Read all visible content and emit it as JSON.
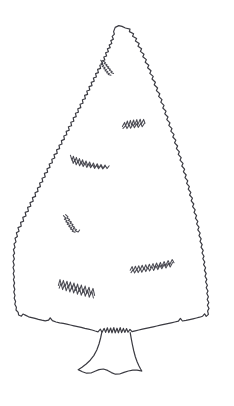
{
  "image": {
    "title": "Evergreen Tree Line Drawing",
    "subject": "conifer-tree",
    "style": "hand-drawn-ink-outline",
    "width": 234,
    "height": 406,
    "background_color": "#ffffff",
    "ink_color": "#3b3b42",
    "branch_ink_color": "#4a4a52"
  },
  "tree": {
    "canopy": {
      "label": "Jagged triangular conifer canopy outline",
      "apex": {
        "x": 115,
        "y": 27
      },
      "left_extent_x": 13,
      "right_extent_x": 209,
      "baseline_y": 333,
      "path": "M115.2,27.4 L113.6,31.6 L114.4,34.2 L112.2,36.4 L113.4,39.2 L110.8,40.6 L111.8,43.4 L109.2,45.0 L110.2,47.6 L107.4,48.8 L108.4,51.8 L105.6,52.8 L106.6,56.0 L103.8,57.0 L104.8,60.0 L101.8,61.0 L102.6,64.2 L99.8,65.2 L100.6,68.4 L97.6,69.4 L98.4,72.6 L95.6,73.6 L96.4,77.0 L93.4,78.0 L94.2,81.2 L91.2,82.4 L92.0,85.6 L89.0,86.6 L89.8,90.0 L86.8,91.0 L87.6,94.4 L84.6,95.4 L85.4,98.8 L82.4,99.8 L83.0,103.2 L80.0,104.2 L80.8,107.6 L77.8,108.8 L78.4,112.2 L75.4,113.2 L76.2,116.6 L73.2,117.8 L73.8,121.2 L70.8,122.2 L71.6,125.8 L68.4,126.8 L69.2,130.2 L66.2,131.4 L66.8,134.8 L63.8,136.0 L64.4,139.4 L61.4,140.6 L62.0,144.0 L59.0,145.2 L59.6,148.6 L56.6,149.8 L57.2,153.4 L54.0,154.6 L54.8,158.0 L51.8,159.2 L52.4,162.8 L49.2,164.0 L50.0,167.4 L47.0,168.8 L47.6,172.2 L44.4,173.4 L45.2,177.0 L42.0,178.2 L42.8,181.8 L39.6,183.0 L40.4,186.6 L37.4,188.0 L38.0,191.4 L35.0,192.8 L35.6,196.4 L32.4,197.6 L33.2,201.2 L30.0,202.6 L30.8,206.2 L27.6,207.4 L28.4,211.2 L25.2,212.4 L26.0,216.0 L22.8,217.4 L23.6,221.2 L20.6,222.4 L21.2,226.2 L18.0,227.6 L19.0,231.2 L16.4,232.8 L17.4,236.4 L15.0,238.2 L16.0,241.8 L14.0,243.8 L15.0,247.4 L13.4,249.6 L14.6,253.2 L13.2,255.4 L14.4,259.0 L13.0,261.4 L14.2,265.0 L13.0,267.4 L14.2,271.0 L13.2,273.6 L14.4,277.0 L13.4,279.6 L14.6,283.0 L13.6,285.8 L14.8,289.2 L13.8,292.0 L15.0,295.4 L14.2,298.2 L15.6,301.4 L14.8,304.2 L16.4,307.2 L16.0,310.0 L18.2,312.4 L18.6,315.0 L21.4,316.2 L23.0,314.0 L25.8,315.4 L28.6,316.8 L31.8,317.6 L35.0,318.4 L38.4,319.4 L41.8,320.2 L45.2,320.8 L48.6,320.2 L50.2,317.8 L52.4,320.6 L56.0,322.0 L59.6,322.8 L63.2,323.4 L66.8,324.2 L70.4,325.0 L74.0,325.8 L77.6,326.6 L81.2,327.4 L84.8,328.4 L88.4,329.2 L92.0,330.0 L95.2,331.0 L98.0,331.8 L100.4,329.2 L102.0,332.2 L104.2,328.4 L105.6,332.4 L107.4,327.8 L108.8,332.6 L110.6,328.0 L112.0,332.8 L113.8,327.6 L115.2,332.8 L117.0,328.2 L118.4,332.8 L120.2,327.6 L121.6,332.6 L123.4,328.4 L124.8,332.4 L126.6,328.6 L128.0,332.2 L130.0,329.4 L132.0,331.6 L135.2,330.8 L138.8,330.0 L142.4,329.2 L146.0,328.4 L149.6,327.6 L153.2,326.8 L156.8,326.0 L160.4,325.2 L164.0,324.4 L167.6,323.6 L171.2,322.8 L174.8,322.0 L178.4,321.2 L180.4,318.4 L182.4,321.0 L186.0,320.4 L189.6,319.6 L193.0,318.8 L196.4,318.0 L199.6,317.2 L202.6,316.2 L204.6,313.8 L206.2,316.4 L208.4,314.4 L207.6,311.0 L209.0,308.4 L207.4,305.2 L208.8,302.6 L207.2,299.4 L208.4,296.8 L206.8,293.6 L208.0,291.0 L206.2,287.8 L207.4,285.2 L205.6,282.0 L206.8,279.4 L205.0,276.2 L206.2,273.6 L204.4,270.4 L205.6,267.8 L203.6,264.6 L204.8,262.0 L202.8,258.8 L204.0,256.2 L202.0,253.0 L203.2,250.4 L201.0,247.2 L202.2,244.6 L200.0,241.4 L201.2,238.8 L199.0,235.6 L200.2,233.0 L197.8,229.8 L199.0,227.2 L196.6,224.0 L197.8,221.4 L195.4,218.2 L196.6,215.6 L194.0,212.4 L195.2,209.8 L192.6,206.6 L193.8,204.0 L191.2,200.8 L192.4,198.2 L189.6,195.0 L190.8,192.4 L188.2,189.2 L189.4,186.6 L186.6,183.4 L187.8,180.8 L185.0,177.6 L186.2,175.0 L183.4,171.8 L184.6,169.2 L181.8,166.0 L183.0,163.4 L180.0,160.2 L181.2,157.6 L178.2,154.4 L179.4,151.8 L176.4,148.6 L177.6,146.0 L174.6,142.8 L175.8,140.2 L172.8,137.0 L174.0,134.4 L170.8,131.2 L172.0,128.6 L168.8,125.4 L170.0,122.8 L166.8,119.6 L168.0,117.0 L164.8,113.8 L166.0,111.2 L162.8,108.0 L164.0,105.4 L160.8,102.2 L162.0,99.6 L158.6,96.4 L159.8,93.8 L156.4,90.6 L157.6,88.0 L154.2,84.8 L155.4,82.2 L152.0,79.0 L153.2,76.4 L149.8,73.4 L151.0,70.8 L147.6,67.8 L148.8,65.2 L145.2,62.2 L146.4,59.6 L142.8,56.8 L144.0,54.2 L140.4,51.4 L141.6,48.8 L138.0,46.2 L139.2,43.6 L135.4,41.0 L136.6,38.6 L132.6,36.2 L133.6,33.8 L129.4,31.6 L130.0,29.2 L125.4,28.0 L122.0,26.4 L118.8,25.6 Z"
    },
    "trunk": {
      "label": "Flared tree trunk with wavy root base",
      "top_y": 332,
      "bottom_y": 374,
      "left_side_path": "M101.8,332.4 L100.6,338.0 L99.0,344.0 L96.8,350.0 L93.8,355.6 L90.2,360.2 L86.2,364.0 L82.0,367.2 L78.6,369.4",
      "right_side_path": "M130.2,332.6 L131.2,338.4 L132.4,344.6 L133.8,351.0 L135.4,357.0 L137.2,362.0 L139.0,366.0 L140.6,369.0 L141.8,371.0",
      "base_path": "M78.2,369.6 L82.4,371.8 L86.6,373.2 L91.0,373.0 L95.0,371.2 L99.0,369.6 L103.4,369.0 L107.6,370.4 L111.4,372.6 L115.4,374.2 L119.6,374.0 L124.0,372.4 L128.4,371.0 L132.8,370.2 L137.0,370.2 L141.2,370.8"
    },
    "branch_marks": [
      {
        "id": "branch-mark-upper-center",
        "label": "Small zigzag branch tuft near treetop",
        "position": {
          "x": 100,
          "y": 60
        },
        "path": "M100.8,60.2 L102.4,63.0 L101.0,63.8 L103.6,65.4 L102.2,66.6 L105.0,67.4 L103.8,68.8 L106.4,69.6 L105.0,70.8 L107.8,71.6 L106.6,72.8 L109.4,73.4 L108.2,74.6 L111.0,75.2 M103.2,61.0 L105.4,62.6 L104.2,63.6 L107.0,64.8 L106.0,65.8 L108.8,67.0 L107.6,68.0 L110.4,69.2 L109.4,70.2 L112.2,71.4 L111.0,72.4 L113.6,73.4"
      },
      {
        "id": "branch-mark-upper-right",
        "label": "Zigzag branch tuft at upper right of canopy",
        "position": {
          "x": 122,
          "y": 118
        },
        "path": "M122.4,126.6 L124.6,122.4 L125.6,126.0 L127.4,121.0 L128.6,125.6 L130.4,120.4 L131.6,125.2 L133.6,120.0 L134.8,124.8 L136.8,119.6 L138.0,124.4 L140.2,119.2 L141.4,124.0 L143.6,119.4 L145.0,123.2 M123.0,128.4 L125.8,125.6 L127.0,128.6 L129.2,124.8 L130.6,128.2 L133.0,124.2 L134.4,127.8 L136.8,123.8 L138.2,127.4 L140.8,123.4 L142.2,126.8 L144.6,123.0"
      },
      {
        "id": "branch-mark-mid-left",
        "label": "Long horizontal zigzag branch at mid-left",
        "position": {
          "x": 70,
          "y": 155
        },
        "path": "M70.4,155.2 L72.0,160.4 L73.4,156.2 L74.8,161.6 L76.4,157.4 L77.8,162.8 L79.4,158.6 L81.0,164.0 L82.6,159.8 L84.2,165.0 L86.0,161.0 L87.8,166.0 L89.6,162.0 L91.4,166.8 L93.4,163.0 L95.2,167.4 L97.2,163.8 L99.0,167.8 L101.0,164.4 L103.0,168.2 L105.0,165.0 L107.0,168.6 L109.2,165.8 M71.8,158.2 L73.2,163.4 L74.8,159.6 L76.2,164.8 L78.0,160.8 L79.6,165.8 L81.4,161.8 L83.2,166.6 L85.0,162.8 L86.8,167.4 L88.8,163.6 L90.6,167.8 L92.6,164.4 L94.6,168.4 L96.6,165.2 L98.6,168.8 L100.8,165.8 L102.8,169.0 L105.0,166.4"
      },
      {
        "id": "branch-mark-lower-left-small",
        "label": "Small diagonal zigzag branch at lower left",
        "position": {
          "x": 63,
          "y": 215
        },
        "path": "M63.4,215.6 L65.8,218.2 L64.4,219.2 L67.2,220.6 L65.8,221.8 L68.6,223.0 L67.2,224.2 L70.2,225.4 L68.8,226.6 L71.8,227.8 L70.4,229.0 L73.4,230.0 L72.2,231.2 L75.0,232.2 M65.6,214.6 L68.0,216.8 L66.8,218.0 L69.6,219.4 L68.4,220.6 L71.4,222.0 L70.0,223.2 L73.0,224.6 L71.8,225.8 L74.6,227.2 L73.4,228.4 L76.4,229.6 L75.2,230.8 L78.2,232.0 L79.6,230.0"
      },
      {
        "id": "branch-mark-lower-right",
        "label": "Long diagonal zigzag branch at lower right",
        "position": {
          "x": 130,
          "y": 258
        },
        "path": "M130.2,270.2 L132.2,266.6 L133.4,270.6 L135.4,266.2 L136.8,270.2 L138.8,265.8 L140.2,269.8 L142.2,265.2 L143.8,269.4 L145.8,264.8 L147.2,269.0 L149.4,264.2 L150.8,268.4 L153.0,263.6 L154.4,267.8 L156.6,263.0 L158.2,267.2 L160.4,262.4 L161.8,266.4 L164.2,261.6 L165.8,265.6 L168.2,260.6 L169.8,264.4 L172.2,259.6 L174.0,262.8 M131.0,272.6 L133.2,269.6 L134.6,273.0 L136.8,269.0 L138.2,272.6 L140.4,268.4 L141.8,272.2 L144.2,267.8 L145.8,271.6 L148.0,267.2 L149.6,271.0 L152.0,266.6 L153.6,270.4 L156.0,266.0 L157.8,269.6 L160.0,265.2 L161.8,268.8 L164.2,264.4 L166.0,268.0 L168.4,263.4 L170.2,267.0 L172.6,262.6"
      },
      {
        "id": "branch-mark-bottom-left",
        "label": "Jagged branch cluster near bottom left",
        "position": {
          "x": 58,
          "y": 278
        },
        "path": "M58.4,285.4 L60.0,279.6 L61.6,286.2 L63.4,280.4 L65.0,287.0 L67.0,281.2 L68.4,288.0 L70.4,282.0 L72.0,289.0 L74.0,283.0 L75.6,290.4 L77.6,284.0 L79.2,291.4 L81.4,285.0 L83.0,292.6 L85.2,286.0 L86.8,293.6 L89.0,287.2 L90.6,294.6 L93.0,288.4 L94.6,295.4 M59.2,288.2 L61.0,283.0 L62.6,289.6 L64.6,284.0 L66.2,290.8 L68.2,285.0 L69.8,292.0 L72.0,286.0 L73.6,293.0 L75.8,287.0 L77.4,294.2 L79.6,288.0 L81.2,295.2 L83.6,289.0 L85.2,296.2 L87.6,290.0 L89.2,297.2 L91.8,291.0 L93.4,298.0"
      }
    ]
  }
}
